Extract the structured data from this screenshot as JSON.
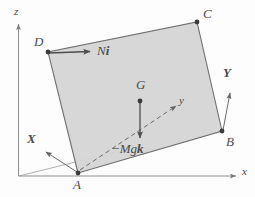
{
  "figure": {
    "background_color": "#fdfdfd",
    "plate_fill_color": "#d5d5d5",
    "stroke_color": "#6e6e6e",
    "label_color": "#4a4a4a"
  },
  "axes": {
    "global": [
      {
        "id": "z",
        "label": "z",
        "orientation": "vertical-up"
      },
      {
        "id": "x",
        "label": "x",
        "orientation": "horizontal-right"
      }
    ],
    "body": [
      {
        "id": "X",
        "label": "X",
        "style": "bold-italic"
      },
      {
        "id": "Y",
        "label": "Y",
        "style": "bold-italic"
      },
      {
        "id": "y",
        "label": "y",
        "style": "italic-dashed"
      }
    ]
  },
  "points": [
    {
      "id": "A",
      "label": "A",
      "x": 78,
      "y": 173
    },
    {
      "id": "B",
      "label": "B",
      "x": 222,
      "y": 131
    },
    {
      "id": "C",
      "label": "C",
      "x": 197,
      "y": 22
    },
    {
      "id": "D",
      "label": "D",
      "x": 48,
      "y": 52
    },
    {
      "id": "G",
      "label": "G",
      "x": 140,
      "y": 101
    }
  ],
  "forces": [
    {
      "id": "normal-force",
      "label_plain": "N",
      "label_vector": "i",
      "applied_at": "D",
      "direction": "horizontal-right"
    },
    {
      "id": "weight-force",
      "label_plain": "−Mg",
      "label_vector": "k",
      "applied_at": "G",
      "direction": "vertical-down"
    }
  ],
  "labels": {
    "z_axis": "z",
    "x_axis": "x",
    "y_axis": "y",
    "X_axis": "X",
    "Y_axis": "Y",
    "point_A": "A",
    "point_B": "B",
    "point_C": "C",
    "point_D": "D",
    "point_G": "G",
    "force_N_scalar": "N",
    "force_N_unit": "i",
    "force_W_scalar": "−Mg",
    "force_W_unit": "k"
  }
}
